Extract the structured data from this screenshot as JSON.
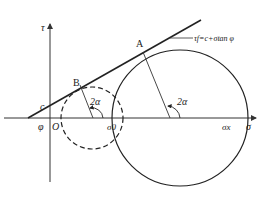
{
  "diagram": {
    "axes": {
      "x_label": "σ",
      "y_label": "τ",
      "origin_label": "O"
    },
    "envelope": {
      "equation": "τf=c+σtan φ",
      "intercept_label": "c",
      "angle_label": "φ"
    },
    "points": {
      "A": "A",
      "B": "B"
    },
    "circles": {
      "failure_circle": {
        "style": "solid",
        "right_label": "σx"
      },
      "initial_circle": {
        "style": "dashed",
        "right_label": "σ0"
      }
    },
    "angle_labels": {
      "small_circle": "2α",
      "large_circle": "2α"
    },
    "colors": {
      "line": "#222222",
      "axis": "#333333",
      "background": "#ffffff"
    }
  }
}
